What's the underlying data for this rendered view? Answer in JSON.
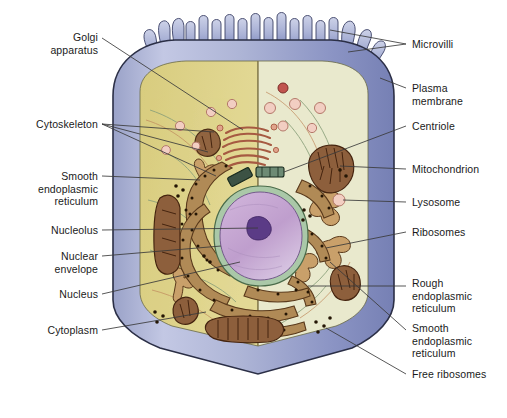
{
  "figure": {
    "width": 507,
    "height": 418
  },
  "colors": {
    "background": "#ffffff",
    "plasma_membrane_light": "#b6bcdc",
    "plasma_membrane_mid": "#a3abd0",
    "plasma_membrane_dark": "#7d87bb",
    "membrane_outline": "#2b2f46",
    "cytoplasm_left": "#ddd289",
    "cytoplasm_right": "#e9e9cd",
    "nucleus_fill": "#c4a3ce",
    "nucleolus_fill": "#5b3b86",
    "nuclear_envelope": "#aac8a8",
    "rough_er": "#b08a56",
    "rough_er_outline": "#5a3a1c",
    "ribosome_dot": "#241504",
    "mitochondrion_fill": "#8d5f3c",
    "mitochondrion_outline": "#45240f",
    "golgi": "#c97a62",
    "centriole": "#3c5244",
    "vesicle_fill": "#f2cec2",
    "vesicle_outline": "#b4796a",
    "smooth_er_line": "#c08a5e",
    "cytoskeleton_line": "#8aa07a",
    "leader_line": "#3a3a3a",
    "label_text": "#1a1a1a"
  },
  "labels": {
    "left": [
      {
        "id": "golgi-apparatus",
        "text": "Golgi\napparatus",
        "x": 38,
        "y": 31,
        "width": 60
      },
      {
        "id": "cytoskeleton",
        "text": "Cytoskeleton",
        "x": 14,
        "y": 118,
        "width": 84
      },
      {
        "id": "smooth-endoplasmic-reticulum-left",
        "text": "Smooth\nendoplasmic\nreticulum",
        "x": 20,
        "y": 170,
        "width": 78
      },
      {
        "id": "nucleolus",
        "text": "Nucleolus",
        "x": 36,
        "y": 224,
        "width": 62
      },
      {
        "id": "nuclear-envelope",
        "text": "Nuclear\nenvelope",
        "x": 34,
        "y": 250,
        "width": 64
      },
      {
        "id": "nucleus",
        "text": "Nucleus",
        "x": 44,
        "y": 288,
        "width": 54
      },
      {
        "id": "cytoplasm",
        "text": "Cytoplasm",
        "x": 32,
        "y": 324,
        "width": 66
      }
    ],
    "right": [
      {
        "id": "microvilli",
        "text": "Microvilli",
        "x": 412,
        "y": 38,
        "width": 80
      },
      {
        "id": "plasma-membrane",
        "text": "Plasma\nmembrane",
        "x": 412,
        "y": 82,
        "width": 80
      },
      {
        "id": "centriole",
        "text": "Centriole",
        "x": 412,
        "y": 120,
        "width": 80
      },
      {
        "id": "mitochondrion",
        "text": "Mitochondrion",
        "x": 412,
        "y": 163,
        "width": 92
      },
      {
        "id": "lysosome",
        "text": "Lysosome",
        "x": 412,
        "y": 196,
        "width": 80
      },
      {
        "id": "ribosomes",
        "text": "Ribosomes",
        "x": 412,
        "y": 226,
        "width": 80
      },
      {
        "id": "rough-endoplasmic-reticulum",
        "text": "Rough\nendoplasmic\nreticulum",
        "x": 412,
        "y": 277,
        "width": 84
      },
      {
        "id": "smooth-endoplasmic-reticulum-right",
        "text": "Smooth\nendoplasmic\nreticulum",
        "x": 412,
        "y": 322,
        "width": 84
      },
      {
        "id": "free-ribosomes",
        "text": "Free ribosomes",
        "x": 412,
        "y": 368,
        "width": 94
      }
    ]
  },
  "organelles": {
    "microvilli_count": 20,
    "mitochondria_count": 6,
    "vesicle_count": 11,
    "centriole_count": 2,
    "golgi_stack_count": 6
  }
}
